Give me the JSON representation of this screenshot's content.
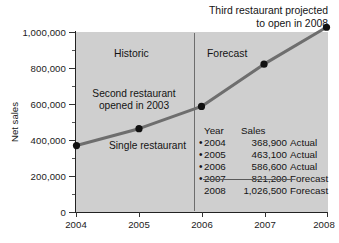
{
  "chart_data": {
    "type": "line",
    "title": "",
    "xlabel": "",
    "ylabel": "Net sales",
    "x": [
      2004,
      2005,
      2006,
      2007,
      2008
    ],
    "categories": [
      "2004",
      "2005",
      "2006",
      "2007",
      "2008"
    ],
    "values": [
      368900,
      463100,
      586600,
      821200,
      1026500
    ],
    "series": [
      {
        "name": "Net sales",
        "values": [
          368900,
          463100,
          586600,
          821200,
          1026500
        ]
      }
    ],
    "ylim": [
      0,
      1000000
    ],
    "yticks": [
      0,
      200000,
      400000,
      600000,
      800000,
      1000000
    ],
    "ytick_labels": [
      "0",
      "200,000",
      "400,000",
      "600,000",
      "800,000",
      "1,000,000"
    ],
    "xticks": [
      2004,
      2005,
      2006,
      2007,
      2008
    ],
    "xtick_labels": [
      "2004",
      "2005",
      "2006",
      "2007",
      "2008"
    ],
    "grid": false,
    "legend": "none",
    "plot_background": "#cfcfcf",
    "line_color": "#6e6e6e",
    "marker_color": "#111111",
    "annotations": [
      "Third restaurant projected to open in 2008",
      "Historic",
      "Forecast",
      "Second restaurant opened in 2003",
      "Single restaurant"
    ],
    "divider_at_x": 2006
  },
  "axes": {
    "y_title": "Net sales",
    "y_ticks": [
      {
        "label": "1,000,000",
        "value": 1000000
      },
      {
        "label": "800,000",
        "value": 800000
      },
      {
        "label": "600,000",
        "value": 600000
      },
      {
        "label": "400,000",
        "value": 400000
      },
      {
        "label": "200,000",
        "value": 200000
      },
      {
        "label": "0",
        "value": 0
      }
    ],
    "x_ticks": [
      {
        "label": "2004",
        "value": 2004
      },
      {
        "label": "2005",
        "value": 2005
      },
      {
        "label": "2006",
        "value": 2006
      },
      {
        "label": "2007",
        "value": 2007
      },
      {
        "label": "2008",
        "value": 2008
      }
    ]
  },
  "callouts": {
    "title_note_line1": "Third restaurant projected",
    "title_note_line2": "to open in 2008",
    "historic": "Historic",
    "forecast": "Forecast",
    "second_restaurant_line1": "Second restaurant",
    "second_restaurant_line2": "opened in 2003",
    "single_restaurant": "Single restaurant"
  },
  "table": {
    "headers": {
      "year": "Year",
      "sales": "Sales"
    },
    "rows": [
      {
        "bullet": "•",
        "year": "2004",
        "sales": "368,900",
        "status": "Actual"
      },
      {
        "bullet": "•",
        "year": "2005",
        "sales": "463,100",
        "status": "Actual"
      },
      {
        "bullet": "•",
        "year": "2006",
        "sales": "586,600",
        "status": "Actual"
      },
      {
        "bullet": "•",
        "year": "2007",
        "sales": "821,200",
        "status": "Forecast"
      },
      {
        "bullet": "",
        "year": "2008",
        "sales": "1,026,500",
        "status": "Forecast"
      }
    ]
  }
}
